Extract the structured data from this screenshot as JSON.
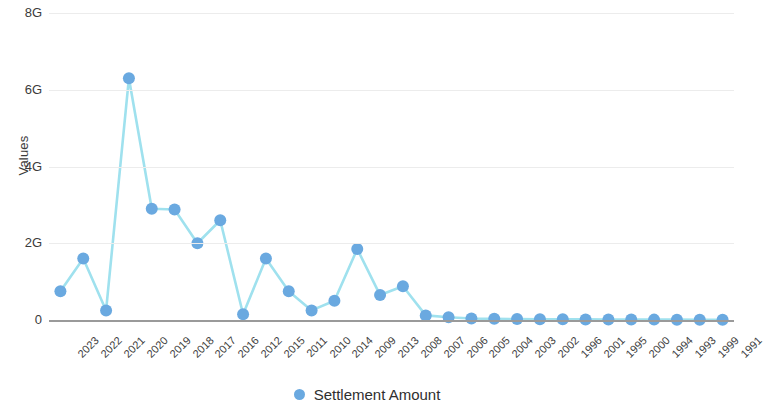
{
  "chart_data": {
    "type": "line",
    "title": "",
    "xlabel": "",
    "ylabel": "Values",
    "ylim": [
      0,
      8000000000
    ],
    "ytick_labels": [
      "8G",
      "6G",
      "4G",
      "2G",
      "0"
    ],
    "ytick_values": [
      8000000000,
      6000000000,
      4000000000,
      2000000000,
      0
    ],
    "grid": true,
    "legend_position": "bottom",
    "marker_color": "#6aa9e0",
    "line_color": "#9fe1ee",
    "series": [
      {
        "name": "Settlement Amount",
        "categories": [
          "2023",
          "2022",
          "2021",
          "2020",
          "2019",
          "2018",
          "2017",
          "2016",
          "2012",
          "2015",
          "2011",
          "2010",
          "2014",
          "2009",
          "2013",
          "2008",
          "2007",
          "2006",
          "2005",
          "2004",
          "2003",
          "2002",
          "1996",
          "2001",
          "1995",
          "2000",
          "1994",
          "1993",
          "1999",
          "1991"
        ],
        "values": [
          750000000,
          1600000000,
          250000000,
          6300000000,
          2900000000,
          2880000000,
          2000000000,
          2600000000,
          150000000,
          1600000000,
          750000000,
          250000000,
          500000000,
          1850000000,
          650000000,
          880000000,
          120000000,
          70000000,
          40000000,
          30000000,
          25000000,
          20000000,
          18000000,
          16000000,
          14000000,
          12000000,
          10000000,
          9000000,
          8000000,
          7000000
        ]
      }
    ]
  },
  "legend": {
    "items": [
      {
        "label": "Settlement Amount",
        "color": "#6aa9e0"
      }
    ]
  }
}
